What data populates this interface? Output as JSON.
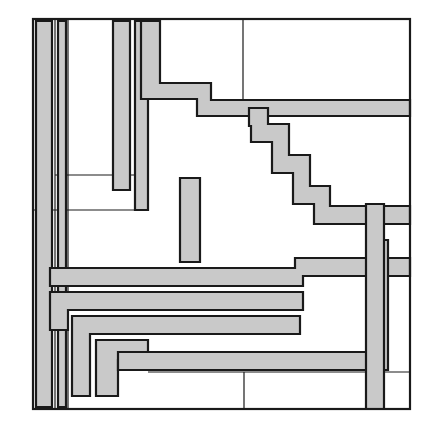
{
  "canvas": {
    "width": 433,
    "height": 429,
    "background": "#ffffff",
    "title": "Abstract geometric band diagram"
  },
  "style": {
    "band_fill": "#c9c9c9",
    "band_stroke": "#1a1a1a",
    "band_stroke_width": 2.2,
    "thin_line_stroke": "#1a1a1a",
    "thin_line_width": 1.2,
    "frame_stroke": "#1a1a1a",
    "frame_stroke_width": 2.2
  },
  "frame": {
    "label": "outer-frame",
    "x": 33,
    "y": 19,
    "width": 377,
    "height": 390
  },
  "thin_lines": [
    {
      "name": "thin-line-upper-left-horizontal",
      "points": "55,175 148,175"
    },
    {
      "name": "thin-line-left-mid-horizontal",
      "points": "33,210 148,210"
    },
    {
      "name": "thin-line-left-lower-horizontal",
      "points": "55,268 148,268"
    },
    {
      "name": "thin-line-top-vertical-divider",
      "points": "152,19 152,68"
    },
    {
      "name": "thin-line-top-right-vertical",
      "points": "243,19 243,100"
    },
    {
      "name": "thin-line-upper-right-horizontal",
      "points": "243,104 410,104"
    },
    {
      "name": "thin-line-mid-right-horizontal",
      "points": "329,212 410,212"
    },
    {
      "name": "thin-line-right-lower-horizontal",
      "points": "329,268 410,268"
    },
    {
      "name": "thin-line-center-stub-divider",
      "points": "180,218 200,218"
    },
    {
      "name": "thin-line-bottom-vertical-divider",
      "points": "244,372 244,409"
    },
    {
      "name": "thin-line-bottom-right-horizontal",
      "points": "148,372 410,372"
    },
    {
      "name": "thin-line-left-band-divider",
      "points": "55,19 55,409"
    },
    {
      "name": "thin-line-second-left-divider",
      "points": "68,19 68,409"
    }
  ],
  "bands": [
    {
      "name": "band-left-vertical-outer",
      "description": "Tall vertical gray band along the left edge running full height",
      "points": "36,21 52,21 52,407 36,407"
    },
    {
      "name": "band-left-vertical-inner",
      "description": "Second vertical gray band just right of the leftmost band",
      "points": "58,21 66,21 66,407 58,407"
    },
    {
      "name": "band-upper-left-tall",
      "description": "Tall narrow vertical band in the upper-left area ending above the mid line",
      "points": "113,21 130,21 130,190 113,190"
    },
    {
      "name": "band-upper-left-hook",
      "description": "Narrow band right of it hooking down to the mid-left region",
      "points": "135,21 148,21 148,210 135,210"
    },
    {
      "name": "band-top-staircase",
      "description": "Wide band from the top notch stepping right and down to the far right edge",
      "points": "141,21 160,21 160,83 211,83 211,100 410,100 410,116 197,116 197,99 141,99"
    },
    {
      "name": "band-main-staircase",
      "description": "Long descending staircase from upper middle to the right edge",
      "points": "249,108 268,108 268,124 289,124 289,155 310,155 310,186 330,186 330,206 410,206 410,224 314,224 314,204 293,204 293,173 272,173 272,142 251,142 251,126 249,126"
    },
    {
      "name": "band-center-vertical-stub",
      "description": "Short vertical gray stub in the centre connecting down to the wide lower band",
      "points": "180,178 200,178 200,262 180,262"
    },
    {
      "name": "band-lower-wide",
      "description": "Wide horizontal gray band across the lower middle of the figure",
      "points": "50,268 295,268 295,258 410,258 410,276 303,276 303,286 50,286"
    },
    {
      "name": "band-lower-second",
      "description": "Second horizontal gray band below, turning up on the left",
      "points": "50,292 303,292 303,310 68,310 68,330 50,330"
    },
    {
      "name": "band-lower-spiral-outer",
      "description": "Spiral band turning from the left side across and down",
      "points": "72,316 300,316 300,334 90,334 90,396 72,396"
    },
    {
      "name": "band-lower-spiral-inner",
      "description": "Inner spiral band hooking down at bottom centre",
      "points": "96,340 148,340 148,360 118,360 118,396 96,396"
    },
    {
      "name": "band-bottom-hook",
      "description": "Bottom hook band sweeping right then rising at the right side",
      "points": "118,352 370,352 370,240 388,240 388,370 118,370"
    },
    {
      "name": "band-right-vertical",
      "description": "Vertical gray band on the right side crossing the horizontal bands",
      "points": "366,204 384,204 384,409 366,409"
    }
  ]
}
